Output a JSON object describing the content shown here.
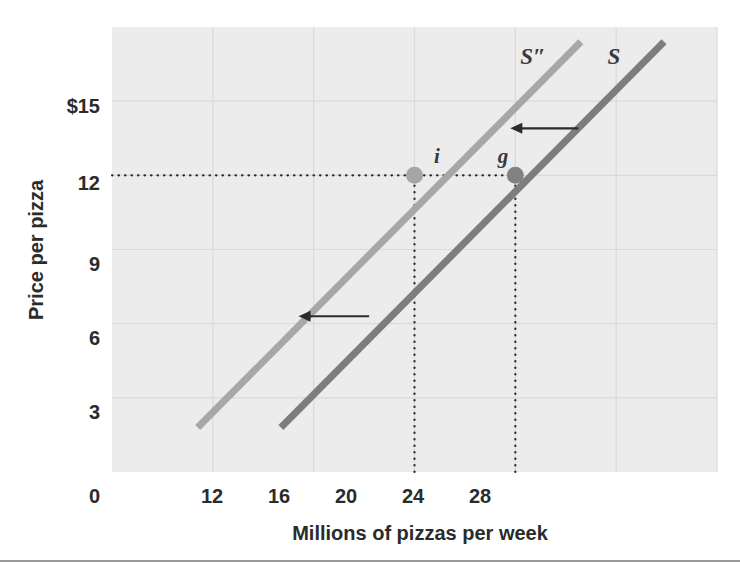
{
  "figure": {
    "background_color": "#ffffff",
    "plot_background_color": "#ececed",
    "grid_color": "#dadada",
    "bottom_rule_color": "#9a9a9a"
  },
  "chart_data": {
    "type": "line",
    "title": "",
    "xlabel": "Millions of pizzas per week",
    "ylabel": "Price per pizza",
    "xlim": [
      8,
      32
    ],
    "ylim": [
      0,
      18
    ],
    "xticks": [
      0,
      12,
      16,
      20,
      24,
      28
    ],
    "xtick_labels": [
      "0",
      "12",
      "16",
      "20",
      "24",
      "28"
    ],
    "yticks": [
      0,
      3,
      6,
      9,
      12,
      15
    ],
    "ytick_labels": [
      "0",
      "3",
      "6",
      "9",
      "12",
      "$15"
    ],
    "grid": true,
    "legend_position": "none",
    "series": [
      {
        "name": "S″",
        "label": "S″",
        "color": "#a7a7a7",
        "x": [
          11.4,
          26.6
        ],
        "y": [
          1.8,
          17.4
        ],
        "description": "shifted supply curve (leftward shift)"
      },
      {
        "name": "S",
        "label": "S",
        "color": "#7d7d7d",
        "x": [
          14.7,
          29.9
        ],
        "y": [
          1.8,
          17.4
        ],
        "description": "original supply curve"
      }
    ],
    "points": [
      {
        "label": "i",
        "x": 20,
        "y": 12,
        "series": "S″",
        "color": "#a5a5a5"
      },
      {
        "label": "g",
        "x": 24,
        "y": 12,
        "series": "S",
        "color": "#818181"
      }
    ],
    "annotations": [
      {
        "name": "shift-arrow-upper",
        "type": "arrow",
        "direction": "left",
        "x_from": 26.5,
        "x_to": 23.8,
        "y": 13.9,
        "color": "#2b2b2b"
      },
      {
        "name": "shift-arrow-lower",
        "type": "arrow",
        "direction": "left",
        "x_from": 18.2,
        "x_to": 15.4,
        "y": 6.3,
        "color": "#2b2b2b"
      }
    ],
    "guides": [
      {
        "name": "price-guide",
        "orientation": "horizontal",
        "value": 12,
        "style": "dotted",
        "from": 8,
        "to": 24
      },
      {
        "name": "quantity-guide-i",
        "orientation": "vertical",
        "value": 20,
        "style": "dotted",
        "from": 0,
        "to": 12
      },
      {
        "name": "quantity-guide-g",
        "orientation": "vertical",
        "value": 24,
        "style": "dotted",
        "from": 0,
        "to": 12
      }
    ]
  }
}
